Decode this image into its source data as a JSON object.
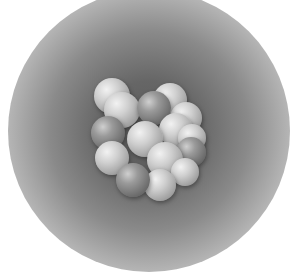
{
  "image": {
    "subject": "atomic nucleus illustration",
    "description": "Cluster of grey spheres (protons and neutrons) on a radial grey gradient halo over white background"
  },
  "colors": {
    "background": "#ffffff",
    "halo_center": "#5a5a5a",
    "light_nucleon": "#d8d8d8",
    "dark_nucleon": "#7a7a7a"
  },
  "nucleons": [
    {
      "type": "light",
      "x": 112,
      "y": 96,
      "r": 18
    },
    {
      "type": "light",
      "x": 170,
      "y": 100,
      "r": 17
    },
    {
      "type": "light",
      "x": 186,
      "y": 118,
      "r": 16
    },
    {
      "type": "light",
      "x": 122,
      "y": 110,
      "r": 18
    },
    {
      "type": "dark",
      "x": 154,
      "y": 108,
      "r": 17
    },
    {
      "type": "light",
      "x": 176,
      "y": 130,
      "r": 17
    },
    {
      "type": "light",
      "x": 192,
      "y": 138,
      "r": 14
    },
    {
      "type": "dark",
      "x": 108,
      "y": 133,
      "r": 17
    },
    {
      "type": "light",
      "x": 145,
      "y": 139,
      "r": 18
    },
    {
      "type": "dark",
      "x": 191,
      "y": 152,
      "r": 15
    },
    {
      "type": "light",
      "x": 112,
      "y": 158,
      "r": 17
    },
    {
      "type": "light",
      "x": 165,
      "y": 160,
      "r": 18
    },
    {
      "type": "light",
      "x": 185,
      "y": 172,
      "r": 14
    },
    {
      "type": "light",
      "x": 160,
      "y": 185,
      "r": 16
    },
    {
      "type": "dark",
      "x": 133,
      "y": 180,
      "r": 17
    }
  ]
}
